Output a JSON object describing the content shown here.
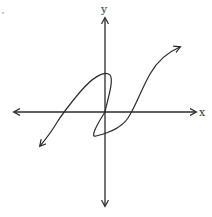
{
  "figure": {
    "x_axis_label": "x",
    "y_axis_label": "y",
    "colors": {
      "background": "#ffffff",
      "ink": "#2a2a2a"
    }
  }
}
